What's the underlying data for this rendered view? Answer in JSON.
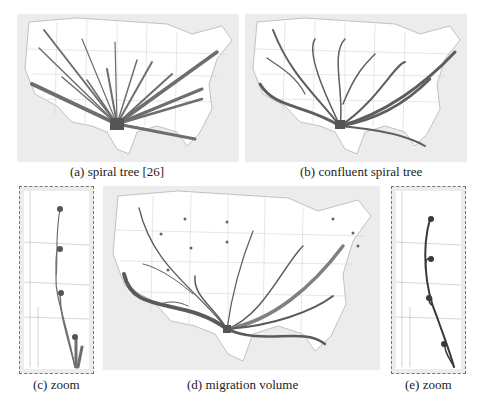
{
  "figure": {
    "panels": [
      {
        "id": "a",
        "caption": "(a) spiral tree [26]"
      },
      {
        "id": "b",
        "caption": "(b) confluent spiral tree"
      },
      {
        "id": "c",
        "caption": "(c) zoom"
      },
      {
        "id": "d",
        "caption": "(d) migration volume"
      },
      {
        "id": "e",
        "caption": "(e) zoom"
      }
    ],
    "colors": {
      "background": "#ececec",
      "map_fill": "#ffffff",
      "state_border": "#aaaaaa",
      "flow": "#6e6e6e",
      "flow_dark": "#4a4a4a",
      "zoom_border": "#777777"
    }
  }
}
